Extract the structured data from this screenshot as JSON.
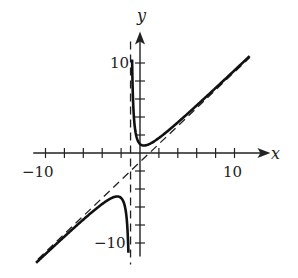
{
  "chart_data": {
    "type": "line",
    "title": "",
    "xlabel": "x",
    "ylabel": "y",
    "xlim": [
      -11,
      13
    ],
    "ylim": [
      -11,
      12
    ],
    "grid": false,
    "legend": "none",
    "x_tick_labels": [
      "-10",
      "10"
    ],
    "y_tick_labels": [
      "10",
      "-10"
    ],
    "tick_spacing": 2,
    "series": [
      {
        "name": "curve",
        "style": "solid",
        "formula": "y = x - 1 + 2/(x+1)",
        "points_right_branch": [
          [
            -0.95,
            38.05
          ],
          [
            -0.85,
            11.48
          ],
          [
            -0.7,
            4.97
          ],
          [
            -0.4,
            1.93
          ],
          [
            0,
            1
          ],
          [
            0.41,
            0.83
          ],
          [
            1,
            1
          ],
          [
            2,
            1.67
          ],
          [
            4,
            3.4
          ],
          [
            6,
            5.29
          ],
          [
            8,
            7.22
          ],
          [
            10,
            9.18
          ],
          [
            11.5,
            10.66
          ]
        ],
        "points_left_branch": [
          [
            -11,
            -11.2
          ],
          [
            -8,
            -9.29
          ],
          [
            -6,
            -7.4
          ],
          [
            -4,
            -5.67
          ],
          [
            -3,
            -5
          ],
          [
            -2.41,
            -4.83
          ],
          [
            -2,
            -5
          ],
          [
            -1.6,
            -5.93
          ],
          [
            -1.3,
            -8.97
          ],
          [
            -1.2,
            -12.2
          ]
        ]
      },
      {
        "name": "vertical asymptote",
        "style": "dashed",
        "equation": "x = -1"
      },
      {
        "name": "slant asymptote",
        "style": "dashed",
        "equation": "y = x - 1"
      }
    ]
  },
  "labels": {
    "x_axis": "x",
    "y_axis": "y",
    "x_neg": "−10",
    "x_pos": "10",
    "y_pos": "10",
    "y_neg": "−10"
  }
}
